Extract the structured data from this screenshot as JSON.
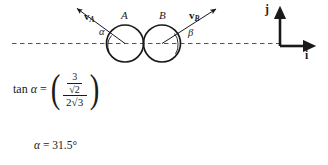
{
  "figure": {
    "type": "physics-collision-diagram",
    "background_color": "#ffffff",
    "stroke_color": "#1a1a1a",
    "dashed_axis_color": "#4a4a4a",
    "circles": [
      {
        "label": "A",
        "cx": 125,
        "cy": 43,
        "r": 18.5
      },
      {
        "label": "B",
        "cx": 162,
        "cy": 43,
        "r": 18.5
      }
    ],
    "vectors": [
      {
        "name": "v_A",
        "label_main": "v",
        "label_sub": "A",
        "label_x": 85,
        "label_y": 12,
        "from_x": 125,
        "from_y": 43,
        "to_x": 74,
        "to_y": 6
      },
      {
        "name": "v_B",
        "label_main": "v",
        "label_sub": "B",
        "label_x": 190,
        "label_y": 11,
        "from_x": 162,
        "from_y": 43,
        "to_x": 219,
        "to_y": 8
      }
    ],
    "angles": [
      {
        "name": "alpha",
        "glyph": "α",
        "x": 100,
        "y": 28
      },
      {
        "name": "beta",
        "glyph": "β",
        "x": 188,
        "y": 28
      }
    ],
    "circle_labels": [
      {
        "text": "A",
        "x": 121,
        "y": 11
      },
      {
        "text": "B",
        "x": 159,
        "y": 11
      }
    ],
    "basis_vectors": {
      "origin_x": 280,
      "origin_y": 46,
      "j": {
        "label": "j",
        "label_x": 265,
        "label_y": 5,
        "tip_x": 280,
        "tip_y": 8
      },
      "i": {
        "label": "i",
        "label_x": 304,
        "label_y": 51,
        "tip_x": 316,
        "tip_y": 46
      }
    },
    "dashed_axis": {
      "x1": 12,
      "x2": 282,
      "y": 43
    }
  },
  "equation": {
    "lhs_function": "tan",
    "lhs_variable": "α",
    "equals": "=",
    "left_paren": "(",
    "right_paren": ")",
    "numerator": {
      "num": "3",
      "den_radical": "√",
      "den_radicand": "2"
    },
    "denominator": {
      "coefficient": "2",
      "radical": "√",
      "radicand": "3"
    },
    "plain_text": "tan α = ( (3/√2) / (2√3) )"
  },
  "result": {
    "variable": "α",
    "equals": "=",
    "value": "31.5",
    "unit": "°",
    "plain_text": "α = 31.5°"
  }
}
